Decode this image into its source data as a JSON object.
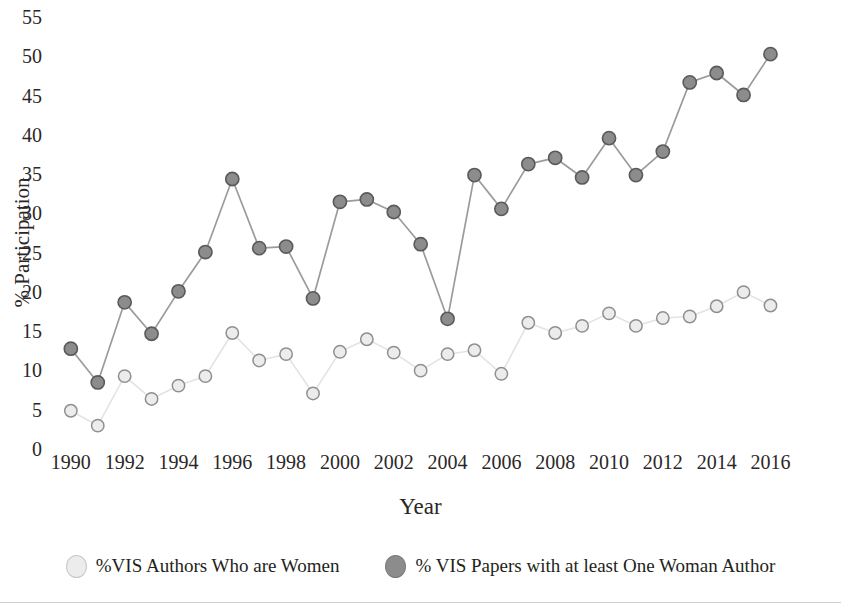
{
  "chart_data": {
    "type": "line",
    "title": "",
    "xlabel": "Year",
    "ylabel": "% Participation",
    "x": [
      1990,
      1991,
      1992,
      1993,
      1994,
      1995,
      1996,
      1997,
      1998,
      1999,
      2000,
      2001,
      2002,
      2003,
      2004,
      2005,
      2006,
      2007,
      2008,
      2009,
      2010,
      2011,
      2012,
      2013,
      2014,
      2015,
      2016
    ],
    "xticks": [
      1990,
      1992,
      1994,
      1996,
      1998,
      2000,
      2002,
      2004,
      2006,
      2008,
      2010,
      2012,
      2014,
      2016
    ],
    "yticks": [
      0,
      5,
      10,
      15,
      20,
      25,
      30,
      35,
      40,
      45,
      50,
      55
    ],
    "xlim": [
      1989.3,
      2016.8
    ],
    "ylim": [
      0,
      55
    ],
    "grid": false,
    "legend_position": "bottom",
    "series": [
      {
        "name": "%VIS Authors Who are Women",
        "color": "#ececec",
        "edge": "#8f8f8f",
        "values": [
          5.0,
          3.1,
          9.4,
          6.5,
          8.2,
          9.4,
          14.9,
          11.4,
          12.2,
          7.2,
          12.5,
          14.1,
          12.4,
          10.1,
          12.2,
          12.7,
          9.7,
          16.2,
          14.9,
          15.8,
          17.4,
          15.8,
          16.8,
          17.0,
          18.3,
          20.1,
          18.4
        ]
      },
      {
        "name": "% VIS Papers with at least One Woman Author",
        "color": "#8c8c8c",
        "edge": "#5a5a5a",
        "values": [
          12.9,
          8.6,
          18.8,
          14.8,
          20.2,
          25.2,
          34.5,
          25.7,
          25.9,
          19.3,
          31.6,
          31.9,
          30.3,
          26.2,
          16.7,
          35.0,
          30.7,
          36.4,
          37.2,
          34.7,
          39.7,
          35.0,
          38.0,
          46.8,
          48.0,
          45.2,
          50.4
        ]
      }
    ]
  },
  "axes": {
    "y_label": "% Participation",
    "x_label": "Year"
  },
  "legend": {
    "items": [
      {
        "label": "%VIS Authors Who are Women",
        "swatch_color": "#ececec",
        "swatch_border": "#c8c8c8"
      },
      {
        "label": "% VIS Papers with at least One Woman Author",
        "swatch_color": "#8c8c8c",
        "swatch_border": "#7a7a7a"
      }
    ]
  },
  "title_clipped": "Figure: Women Participation in IEEE VIS"
}
